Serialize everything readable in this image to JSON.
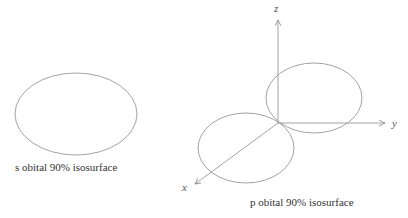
{
  "diagrams": {
    "s_orbital": {
      "caption": "s obital 90% isosurface",
      "shape": "ellipse"
    },
    "p_orbital": {
      "caption": "p obital 90% isosurface",
      "axes": {
        "x": "x",
        "y": "y",
        "z": "z"
      },
      "lobes": 2
    }
  },
  "colors": {
    "stroke": "#888888",
    "text": "#333333"
  }
}
